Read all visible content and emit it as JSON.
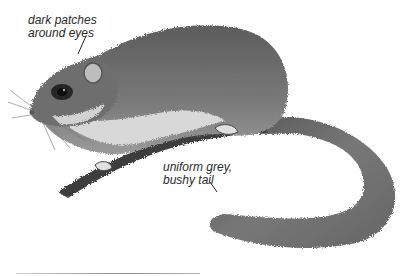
{
  "figure": {
    "annotations": [
      {
        "lines": [
          "dark patches",
          "around eyes"
        ]
      },
      {
        "lines": [
          "uniform grey,",
          "bushy tail"
        ]
      }
    ],
    "colors": {
      "background": "#ffffff",
      "fur_dark": "#4a4a4a",
      "fur_mid": "#7d7d7d",
      "fur_light": "#c9c9c9",
      "branch": "#3a3a3a",
      "label_text": "#2a2a2a"
    }
  }
}
